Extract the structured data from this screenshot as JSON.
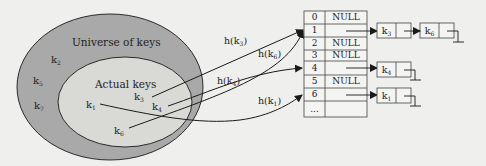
{
  "diagram": {
    "universe_label": "Universe of keys",
    "actual_label": "Actual keys",
    "colors": {
      "background": "#efefed",
      "universe_fill": "#a9a9a9",
      "actual_fill": "#d9d9d6",
      "stroke": "#2a2a2a"
    },
    "universe_keys": [
      {
        "base": "k",
        "sub": "2"
      },
      {
        "base": "k",
        "sub": "5"
      },
      {
        "base": "k",
        "sub": "7"
      }
    ],
    "actual_keys": [
      {
        "base": "k",
        "sub": "1"
      },
      {
        "base": "k",
        "sub": "3"
      },
      {
        "base": "k",
        "sub": "4"
      },
      {
        "base": "k",
        "sub": "6"
      }
    ],
    "hash_labels": [
      {
        "base": "h(k",
        "sub": "3",
        "end": ")"
      },
      {
        "base": "h(k",
        "sub": "6",
        "end": ")"
      },
      {
        "base": "h(k",
        "sub": "4",
        "end": ")"
      },
      {
        "base": "h(k",
        "sub": "1",
        "end": ")"
      }
    ],
    "table": {
      "rows": [
        {
          "index": "0",
          "value": "NULL"
        },
        {
          "index": "1",
          "value": ""
        },
        {
          "index": "2",
          "value": "NULL"
        },
        {
          "index": "3",
          "value": "NULL"
        },
        {
          "index": "4",
          "value": ""
        },
        {
          "index": "5",
          "value": "NULL"
        },
        {
          "index": "6",
          "value": ""
        },
        {
          "index": "...",
          "value": ""
        }
      ]
    },
    "chains": [
      {
        "slot": "1",
        "nodes": [
          {
            "base": "k",
            "sub": "3"
          },
          {
            "base": "k",
            "sub": "6"
          }
        ]
      },
      {
        "slot": "4",
        "nodes": [
          {
            "base": "k",
            "sub": "4"
          }
        ]
      },
      {
        "slot": "6",
        "nodes": [
          {
            "base": "k",
            "sub": "1"
          }
        ]
      }
    ]
  }
}
